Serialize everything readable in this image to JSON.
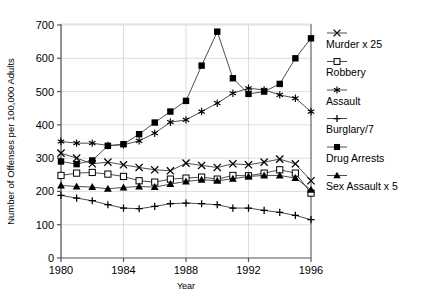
{
  "chart_data": {
    "type": "line",
    "title": "",
    "xlabel": "Year",
    "ylabel": "Number of Offenses per 100,000 Adults",
    "xlim": [
      1980,
      1996
    ],
    "ylim": [
      0,
      700
    ],
    "ytick_values": [
      0,
      100,
      200,
      300,
      400,
      500,
      600,
      700
    ],
    "ytick_labels": [
      "0",
      "100",
      "200",
      "300",
      "400",
      "500",
      "600",
      "700"
    ],
    "xtick_values": [
      1980,
      1984,
      1988,
      1992,
      1996
    ],
    "xtick_labels": [
      "1980",
      "1984",
      "1988",
      "1992",
      "1996"
    ],
    "grid": true,
    "legend_position": "right",
    "x": [
      1980,
      1981,
      1982,
      1983,
      1984,
      1985,
      1986,
      1987,
      1988,
      1989,
      1990,
      1991,
      1992,
      1993,
      1994,
      1995,
      1996
    ],
    "series": [
      {
        "name": "Murder x 25",
        "marker": "x",
        "values": [
          315,
          300,
          283,
          288,
          280,
          272,
          265,
          262,
          285,
          278,
          272,
          283,
          280,
          288,
          297,
          283,
          232
        ]
      },
      {
        "name": "Robbery",
        "marker": "open-square",
        "values": [
          248,
          255,
          257,
          252,
          245,
          232,
          228,
          237,
          240,
          243,
          237,
          248,
          247,
          255,
          265,
          255,
          195
        ]
      },
      {
        "name": "Assault",
        "marker": "asterisk",
        "values": [
          350,
          345,
          345,
          338,
          340,
          352,
          375,
          408,
          415,
          440,
          465,
          495,
          510,
          505,
          490,
          480,
          440
        ]
      },
      {
        "name": "Burglary/7",
        "marker": "plus",
        "values": [
          188,
          180,
          172,
          160,
          150,
          148,
          155,
          163,
          165,
          163,
          160,
          150,
          150,
          143,
          137,
          128,
          115
        ]
      },
      {
        "name": "Drug Arrests",
        "marker": "filled-square",
        "values": [
          290,
          282,
          293,
          337,
          342,
          372,
          407,
          440,
          472,
          578,
          680,
          540,
          493,
          500,
          523,
          600,
          660
        ]
      },
      {
        "name": "Sex Assault x 5",
        "marker": "filled-triangle",
        "values": [
          218,
          215,
          213,
          208,
          212,
          215,
          213,
          222,
          230,
          235,
          232,
          238,
          245,
          248,
          248,
          240,
          205
        ]
      }
    ]
  },
  "caption": {
    "text": ""
  }
}
